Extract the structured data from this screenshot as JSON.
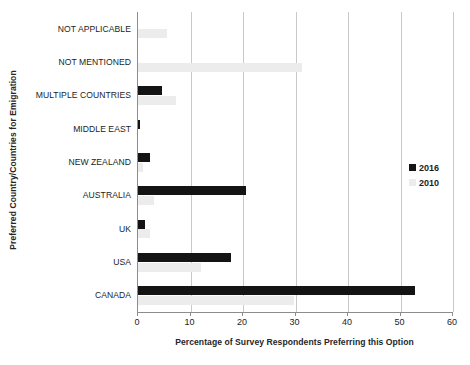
{
  "chart_data": {
    "type": "bar",
    "orientation": "horizontal",
    "title": "",
    "xlabel": "Percentage of Survey Respondents Preferring this Option",
    "ylabel": "Preferred Country/Countries for Emigration",
    "categories": [
      "NOT APPLICABLE",
      "NOT MENTIONED",
      "MULTIPLE COUNTRIES",
      "MIDDLE EAST",
      "NEW ZEALAND",
      "AUSTRALIA",
      "UK",
      "USA",
      "CANADA"
    ],
    "series": [
      {
        "name": "2016",
        "color": "#141414",
        "values": [
          0,
          0,
          4.6,
          0.4,
          2.3,
          20.6,
          1.4,
          17.8,
          52.8
        ]
      },
      {
        "name": "2010",
        "color": "#ececec",
        "values": [
          5.6,
          31.2,
          7.2,
          0,
          0.9,
          3.0,
          2.3,
          12.0,
          29.8
        ]
      }
    ],
    "xlim": [
      0,
      60
    ],
    "xticks": [
      0,
      10,
      20,
      30,
      40,
      50,
      60
    ],
    "xtick_labels": [
      "0",
      "10",
      "20",
      "30",
      "40",
      "50",
      "60"
    ],
    "grid": "vertical",
    "legend_position": "right-middle",
    "legend_entries": [
      "2016",
      "2010"
    ]
  }
}
